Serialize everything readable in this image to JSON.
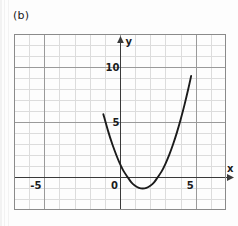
{
  "figure": {
    "panel_label": "(b)",
    "background_color": "#fdfdfd",
    "frame_color": "#8a8a8a",
    "minor_grid_color": "#dcdcdc",
    "major_grid_color": "#9a9a9a",
    "axis_color": "#3a3a3a",
    "curve_color": "#1b1b1b"
  },
  "chart_data": {
    "type": "line",
    "title": "(b)",
    "xlabel": "x",
    "ylabel": "y",
    "xlim": [
      -7,
      7
    ],
    "ylim": [
      -3,
      13
    ],
    "grid": true,
    "grid_minor_step": 1,
    "grid_major_step": 5,
    "legend": null,
    "x_tick_labels": [
      "-5",
      "0",
      "5"
    ],
    "x_tick_values": [
      -5,
      0,
      5
    ],
    "y_tick_labels": [
      "5",
      "10"
    ],
    "y_tick_values": [
      5,
      10
    ],
    "axis_arrows": [
      "x-positive",
      "y-positive"
    ],
    "annotations": [],
    "series": [
      {
        "name": "parabola",
        "equation": "y = x^2 - 3x + 1.2",
        "vertex": [
          1.5,
          -1.1
        ],
        "y_intercept": 4.5,
        "x_domain": [
          -1.1,
          4.7
        ],
        "x": [
          -1.1,
          -0.8,
          -0.5,
          -0.2,
          0.0,
          0.25,
          0.5,
          0.75,
          1.0,
          1.25,
          1.5,
          1.75,
          2.0,
          2.25,
          2.5,
          2.75,
          3.0,
          3.25,
          3.5,
          3.75,
          4.0,
          4.25,
          4.5,
          4.7
        ],
        "y": [
          5.71,
          4.24,
          2.95,
          1.84,
          1.2,
          0.51,
          0.0,
          -0.49,
          -0.8,
          -0.99,
          -1.05,
          -0.99,
          -0.8,
          -0.49,
          0.0,
          0.51,
          1.2,
          2.01,
          2.95,
          4.01,
          5.2,
          6.51,
          7.95,
          9.19
        ]
      }
    ]
  }
}
